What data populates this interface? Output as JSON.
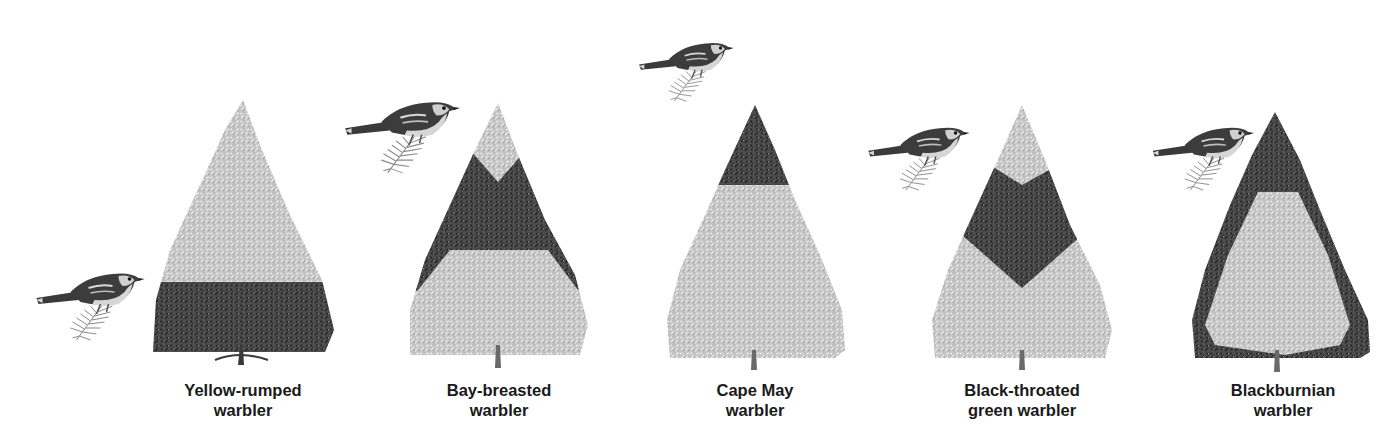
{
  "figure": {
    "colors": {
      "background": "#ffffff",
      "foliage_light": "#c4c4c4",
      "foliage_light_texture": "#e6e6e6",
      "foliage_dark": "#4a4a4a",
      "foliage_dark_texture": "#2a2a2a",
      "trunk": "#5a5a5a",
      "bird_body": "#3c3c3c",
      "bird_light": "#d9d9d9",
      "label_text": "#1a1a1a"
    },
    "panels": [
      {
        "label_line1": "Yellow-rumped",
        "label_line2": "warbler",
        "feeding_zone": "lower third of tree (dark band at base)",
        "icons": {
          "bird": "warbler-bird-icon",
          "tree": "spruce-tree-icon"
        }
      },
      {
        "label_line1": "Bay-breasted",
        "label_line2": "warbler",
        "feeding_zone": "middle interior (dark V-band)",
        "icons": {
          "bird": "warbler-bird-icon",
          "tree": "spruce-tree-icon"
        }
      },
      {
        "label_line1": "Cape May",
        "label_line2": "warbler",
        "feeding_zone": "top of tree (dark apex)",
        "icons": {
          "bird": "warbler-bird-icon",
          "tree": "spruce-tree-icon"
        }
      },
      {
        "label_line1": "Black-throated",
        "label_line2": "green warbler",
        "feeding_zone": "upper-middle interior (dark chevron)",
        "icons": {
          "bird": "warbler-bird-icon",
          "tree": "spruce-tree-icon"
        }
      },
      {
        "label_line1": "Blackburnian",
        "label_line2": "warbler",
        "feeding_zone": "outer shell of tree (dark periphery)",
        "icons": {
          "bird": "warbler-bird-icon",
          "tree": "spruce-tree-icon"
        }
      }
    ]
  }
}
